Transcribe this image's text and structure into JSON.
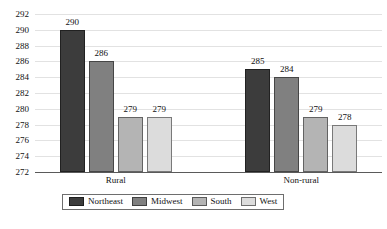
{
  "chart_data": {
    "type": "bar",
    "title": "",
    "subtitle": "",
    "xlabel": "",
    "ylabel": "",
    "categories": [
      "Rural",
      "Non-rural"
    ],
    "series": [
      {
        "name": "Northeast",
        "values": [
          290,
          285
        ],
        "color": "#3c3c3c"
      },
      {
        "name": "Midwest",
        "values": [
          286,
          284
        ],
        "color": "#808080"
      },
      {
        "name": "South",
        "values": [
          279,
          279
        ],
        "color": "#b4b4b4"
      },
      {
        "name": "West",
        "values": [
          279,
          278
        ],
        "color": "#dcdcdc"
      }
    ],
    "ylim": [
      272,
      292
    ],
    "ytick_step": 2,
    "yticks": [
      292,
      290,
      288,
      286,
      284,
      282,
      280,
      278,
      276,
      274,
      272
    ],
    "grid": true,
    "grid_axis": "y",
    "legend": true,
    "legend_position": "bottom-center",
    "data_labels": true,
    "gridline_color": "#e2e2e2",
    "axis_color": "#5a5a5a"
  }
}
